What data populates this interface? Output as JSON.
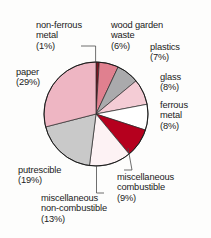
{
  "figure": {
    "background_color": "#fdfdfc",
    "outline_color": "#1b1b1b"
  },
  "chart_data": {
    "type": "pie",
    "title": "",
    "subtitle": "",
    "xlabel": "",
    "ylabel": "",
    "grid": false,
    "legend_position": "none",
    "label_format": "name (value%)",
    "start_angle_deg": 0,
    "direction": "clockwise",
    "center": {
      "x": 96,
      "y": 114
    },
    "radius": 52,
    "total": 100,
    "units": "%",
    "categories": [
      "non-ferrous metal",
      "wood garden waste",
      "plastics",
      "glass",
      "ferrous metal",
      "miscellaneous combustible",
      "miscellaneous non-combustible",
      "putrescible",
      "paper"
    ],
    "values": [
      1,
      6,
      7,
      8,
      8,
      9,
      13,
      19,
      29
    ],
    "colors": [
      "#7d1420",
      "#e0808f",
      "#aaaaac",
      "#f4ccd5",
      "#ffffff",
      "#b5001e",
      "#fdf2f4",
      "#c9c9c9",
      "#eeb6c3"
    ],
    "slices": [
      {
        "name": "non-ferrous metal",
        "value": 1,
        "color": "#7d1420",
        "label_text": "non-ferrous\nmetal\n(1%)",
        "leader_line": true
      },
      {
        "name": "wood garden waste",
        "value": 6,
        "color": "#e0808f",
        "label_text": "wood garden\nwaste\n(6%)",
        "leader_line": false
      },
      {
        "name": "plastics",
        "value": 7,
        "color": "#aaaaac",
        "label_text": "plastics\n(7%)",
        "leader_line": false
      },
      {
        "name": "glass",
        "value": 8,
        "color": "#f4ccd5",
        "label_text": "glass\n(8%)",
        "leader_line": false
      },
      {
        "name": "ferrous metal",
        "value": 8,
        "color": "#ffffff",
        "label_text": "ferrous\nmetal\n(8%)",
        "leader_line": false
      },
      {
        "name": "miscellaneous combustible",
        "value": 9,
        "color": "#b5001e",
        "label_text": "miscellaneous\ncombustible\n(9%)",
        "leader_line": true
      },
      {
        "name": "miscellaneous non-combustible",
        "value": 13,
        "color": "#fdf2f4",
        "label_text": "miscellaneous\nnon-combustible\n(13%)",
        "leader_line": true
      },
      {
        "name": "putrescible",
        "value": 19,
        "color": "#c9c9c9",
        "label_text": "putrescible\n(19%)",
        "leader_line": false
      },
      {
        "name": "paper",
        "value": 29,
        "color": "#eeb6c3",
        "label_text": "paper\n(29%)",
        "leader_line": false
      }
    ]
  },
  "labels": {
    "non_ferrous_metal": "non-ferrous\nmetal\n(1%)",
    "wood_garden_waste": "wood garden\nwaste\n(6%)",
    "plastics": "plastics\n(7%)",
    "glass": "glass\n(8%)",
    "ferrous_metal": "ferrous\nmetal\n(8%)",
    "miscellaneous_combustible": "miscellaneous\ncombustible\n(9%)",
    "miscellaneous_non_combustible": "miscellaneous\nnon-combustible\n(13%)",
    "putrescible": "putrescible\n(19%)",
    "paper": "paper\n(29%)"
  }
}
